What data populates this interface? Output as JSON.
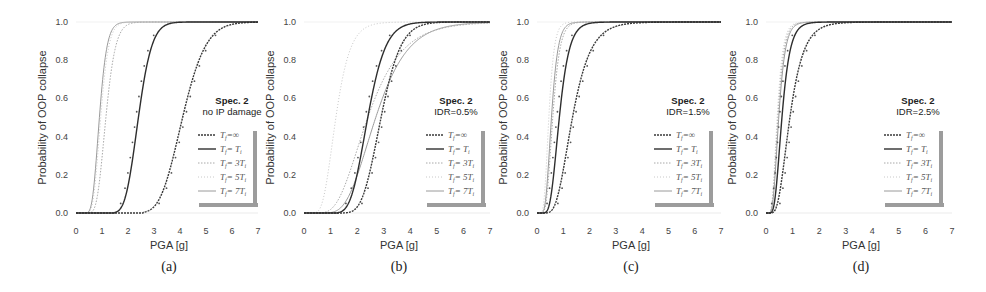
{
  "figure": {
    "ylabel": "Probability of OOP collapse",
    "xlabel": "PGA [g]",
    "yticks": [
      "0.0",
      "0.2",
      "0.4",
      "0.6",
      "0.8",
      "1.0"
    ],
    "xticks": [
      "0",
      "1",
      "2",
      "3",
      "4",
      "5",
      "6",
      "7"
    ],
    "legend_entries": [
      "T_f=∞",
      "T_f= T_i",
      "T_f= 3T_i",
      "T_f= 5T_i",
      "T_f= 7T_i"
    ],
    "legend_labels_display": [
      {
        "main": "T",
        "sub": "f",
        "rest": "=∞"
      },
      {
        "main": "T",
        "sub": "f",
        "rest": "= T",
        "sub2": "i"
      },
      {
        "main": "T",
        "sub": "f",
        "rest": "= 3T",
        "sub2": "i"
      },
      {
        "main": "T",
        "sub": "f",
        "rest": "= 5T",
        "sub2": "i"
      },
      {
        "main": "T",
        "sub": "f",
        "rest": "= 7T",
        "sub2": "i"
      }
    ],
    "series_styles": [
      {
        "color": "#3a3a3a",
        "width": 1.4,
        "dash": "2,1"
      },
      {
        "color": "#2e2e2e",
        "width": 1.4,
        "dash": ""
      },
      {
        "color": "#a8a8a8",
        "width": 1.0,
        "dash": "1.5,1.5"
      },
      {
        "color": "#c8c8c8",
        "width": 1.0,
        "dash": "1,2"
      },
      {
        "color": "#9a9a9a",
        "width": 1.0,
        "dash": ""
      }
    ]
  },
  "chart_data": [
    {
      "type": "line",
      "panel": "(a)",
      "title": "Spec. 2",
      "subtitle": "no IP damage",
      "xlabel": "PGA [g]",
      "ylabel": "Probability of OOP collapse",
      "xlim": [
        0,
        7
      ],
      "ylim": [
        0,
        1
      ],
      "grid": false,
      "legend_position": "center-right",
      "series": [
        {
          "name": "T_f=∞",
          "median": 4.1,
          "beta": 0.17,
          "start": 2.6
        },
        {
          "name": "T_f= T_i",
          "median": 2.4,
          "beta": 0.17,
          "start": 1.5
        },
        {
          "name": "T_f= 3T_i",
          "median": 1.15,
          "beta": 0.25,
          "start": 0.3
        },
        {
          "name": "T_f= 5T_i",
          "median": 0.95,
          "beta": 0.25,
          "start": 0.3
        },
        {
          "name": "T_f= 7T_i",
          "median": 0.9,
          "beta": 0.25,
          "start": 0.3
        }
      ]
    },
    {
      "type": "line",
      "panel": "(b)",
      "title": "Spec. 2",
      "subtitle": "IDR=0.5%",
      "xlabel": "PGA [g]",
      "ylabel": "Probability of OOP collapse",
      "xlim": [
        0,
        7
      ],
      "ylim": [
        0,
        1
      ],
      "grid": false,
      "legend_position": "center-right",
      "series": [
        {
          "name": "T_f=∞",
          "median": 2.9,
          "beta": 0.2,
          "start": 1.3
        },
        {
          "name": "T_f= T_i",
          "median": 2.4,
          "beta": 0.22,
          "start": 1.3
        },
        {
          "name": "T_f= 3T_i",
          "median": 2.4,
          "beta": 0.42,
          "start": 0.4
        },
        {
          "name": "T_f= 5T_i",
          "median": 1.2,
          "beta": 0.35,
          "start": 0.3
        },
        {
          "name": "T_f= 7T_i",
          "median": 2.7,
          "beta": 0.35,
          "start": 0.8
        }
      ]
    },
    {
      "type": "line",
      "panel": "(c)",
      "title": "Spec. 2",
      "subtitle": "IDR=1.5%",
      "xlabel": "PGA [g]",
      "ylabel": "Probability of OOP collapse",
      "xlim": [
        0,
        7
      ],
      "ylim": [
        0,
        1
      ],
      "grid": false,
      "legend_position": "center-right",
      "series": [
        {
          "name": "T_f=∞",
          "median": 1.35,
          "beta": 0.4,
          "start": 0.35
        },
        {
          "name": "T_f= T_i",
          "median": 0.85,
          "beta": 0.35,
          "start": 0.25
        },
        {
          "name": "T_f= 3T_i",
          "median": 0.6,
          "beta": 0.35,
          "start": 0.1
        },
        {
          "name": "T_f= 5T_i",
          "median": 0.45,
          "beta": 0.35,
          "start": 0.1
        },
        {
          "name": "T_f= 7T_i",
          "median": 0.55,
          "beta": 0.35,
          "start": 0.1
        }
      ]
    },
    {
      "type": "line",
      "panel": "(d)",
      "title": "Spec. 2",
      "subtitle": "IDR=2.5%",
      "xlabel": "PGA [g]",
      "ylabel": "Probability of OOP collapse",
      "xlim": [
        0,
        7
      ],
      "ylim": [
        0,
        1
      ],
      "grid": false,
      "legend_position": "center-right",
      "series": [
        {
          "name": "T_f=∞",
          "median": 0.9,
          "beta": 0.45,
          "start": 0.2
        },
        {
          "name": "T_f= T_i",
          "median": 0.6,
          "beta": 0.4,
          "start": 0.15
        },
        {
          "name": "T_f= 3T_i",
          "median": 0.45,
          "beta": 0.4,
          "start": 0.05
        },
        {
          "name": "T_f= 5T_i",
          "median": 0.42,
          "beta": 0.4,
          "start": 0.05
        },
        {
          "name": "T_f= 7T_i",
          "median": 0.48,
          "beta": 0.4,
          "start": 0.05
        }
      ]
    }
  ],
  "layout": {
    "panels": [
      {
        "x0": 76,
        "x7": 258,
        "ytop": 22,
        "ybot": 213,
        "legend_x": 196,
        "legend_y": 128,
        "title_x": 232,
        "title_y": 104
      },
      {
        "x0": 304,
        "x7": 490,
        "ytop": 22,
        "ybot": 213,
        "legend_x": 424,
        "legend_y": 128,
        "title_x": 456,
        "title_y": 104
      },
      {
        "x0": 537,
        "x7": 721,
        "ytop": 22,
        "ybot": 213,
        "legend_x": 652,
        "legend_y": 128,
        "title_x": 688,
        "title_y": 104
      },
      {
        "x0": 766,
        "x7": 952,
        "ytop": 22,
        "ybot": 213,
        "legend_x": 882,
        "legend_y": 128,
        "title_x": 918,
        "title_y": 104
      }
    ]
  }
}
